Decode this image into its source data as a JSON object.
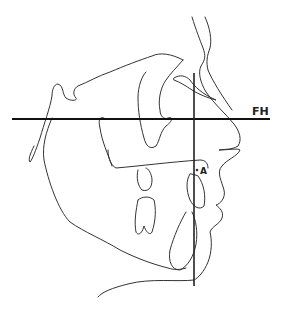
{
  "diagram": {
    "type": "cephalometric-tracing",
    "view": "lateral-profile-facing-right",
    "labels": {
      "fh": "FH",
      "a_point": "A"
    },
    "reference_lines": {
      "frankfort_horizontal": {
        "label": "FH",
        "x1": 12,
        "y1": 119,
        "x2": 270,
        "y2": 119
      },
      "vertical_reference": {
        "x1": 194,
        "y1": 73,
        "x2": 194,
        "y2": 286
      }
    },
    "landmarks": [
      {
        "name": "A",
        "x": 197,
        "y": 170
      }
    ],
    "colors": {
      "stroke": "#333333",
      "reference": "#111111",
      "background": "#ffffff"
    }
  }
}
